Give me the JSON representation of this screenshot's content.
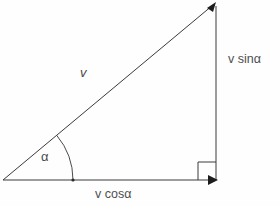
{
  "diagram": {
    "background_color": "#fefefe",
    "line_color": "#3a3a3a",
    "text_color": "#4e4e4e",
    "labels": {
      "hypotenuse": "v",
      "vertical_component": "v sinα",
      "horizontal_component": "v cosα",
      "angle": "α"
    },
    "geometry": {
      "origin_x": 3,
      "origin_y": 180,
      "apex_x": 216,
      "apex_y": 3,
      "corner_x": 216,
      "corner_y": 180,
      "angle_degrees": 39.7,
      "arc_radius": 70,
      "right_angle_box_size": 18
    }
  }
}
